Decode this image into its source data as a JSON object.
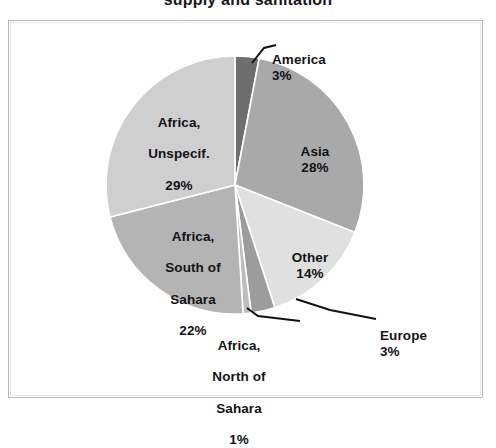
{
  "chart_data": {
    "type": "pie",
    "title": "supply and sanitation",
    "title_clipped": true,
    "xlabel": "",
    "ylabel": "",
    "legend_position": "none",
    "labels_inside": [
      "Asia",
      "Other",
      "Africa, South of Sahara",
      "Africa, Unspecif."
    ],
    "labels_outside": [
      "America",
      "Europe",
      "Africa, North of Sahara"
    ],
    "categories": [
      "America",
      "Asia",
      "Other",
      "Europe",
      "Africa, North of Sahara",
      "Africa, South of Sahara",
      "Africa, Unspecif."
    ],
    "values": [
      3,
      28,
      14,
      3,
      1,
      22,
      29
    ],
    "unit": "%",
    "slices": [
      {
        "name": "America",
        "label": "America",
        "percent": 3,
        "percent_text": "3%",
        "color": "#6e6e6e",
        "start_angle": 352,
        "end_angle": 363,
        "label_placement": "outside",
        "leader_line": true
      },
      {
        "name": "Asia",
        "label": "Asia",
        "percent": 28,
        "percent_text": "28%",
        "color": "#a9a9a9",
        "start_angle": 363,
        "end_angle": 463,
        "label_placement": "inside",
        "leader_line": false
      },
      {
        "name": "Other",
        "label": "Other",
        "percent": 14,
        "percent_text": "14%",
        "color": "#e0e0e0",
        "start_angle": 463,
        "end_angle": 513,
        "label_placement": "inside",
        "leader_line": false
      },
      {
        "name": "Europe",
        "label": "Europe",
        "percent": 3,
        "percent_text": "3%",
        "color": "#9c9c9c",
        "start_angle": 513,
        "end_angle": 524,
        "label_placement": "outside",
        "leader_line": true
      },
      {
        "name": "Africa, North of Sahara",
        "label": "Africa,\nNorth of\nSahara",
        "percent": 1,
        "percent_text": "1%",
        "color": "#bdbdbd",
        "start_angle": 524,
        "end_angle": 528,
        "label_placement": "outside",
        "leader_line": true
      },
      {
        "name": "Africa, South of Sahara",
        "label": "Africa,\nSouth of\nSahara",
        "percent": 22,
        "percent_text": "22%",
        "color": "#b4b4b4",
        "start_angle": 528,
        "end_angle": 607,
        "label_placement": "inside",
        "leader_line": false
      },
      {
        "name": "Africa, Unspecif.",
        "label": "Africa,\nUnspecif.",
        "percent": 29,
        "percent_text": "29%",
        "color": "#cfcfcf",
        "start_angle": 607,
        "end_angle": 712,
        "label_placement": "inside",
        "leader_line": false
      }
    ]
  },
  "labels": {
    "america": {
      "name": "America",
      "pct": "3%"
    },
    "asia": {
      "name": "Asia",
      "pct": "28%"
    },
    "other": {
      "name": "Other",
      "pct": "14%"
    },
    "europe": {
      "name": "Europe",
      "pct": "3%"
    },
    "africa_north": {
      "line1": "Africa,",
      "line2": "North of",
      "line3": "Sahara",
      "pct": "1%"
    },
    "africa_south": {
      "line1": "Africa,",
      "line2": "South of",
      "line3": "Sahara",
      "pct": "22%"
    },
    "africa_unspecified": {
      "line1": "Africa,",
      "line2": "Unspecif.",
      "pct": "29%"
    }
  },
  "frame": {
    "border_color": "#b9b9b9",
    "background": "#ffffff"
  }
}
